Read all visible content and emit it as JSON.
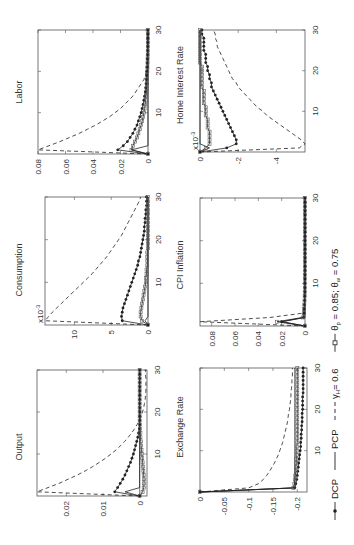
{
  "chart_data": [
    {
      "type": "line",
      "title": "Labor",
      "xlabel": "",
      "ylabel": "",
      "xlim": [
        0,
        30
      ],
      "ylim": [
        0,
        0.08
      ],
      "xticks": [
        "10",
        "20",
        "30"
      ],
      "yticks": [
        "0",
        "0.02",
        "0.04",
        "0.06",
        "0.08"
      ],
      "ytick_values": [
        0,
        0.02,
        0.04,
        0.06,
        0.08
      ],
      "scale_label": "",
      "series": [
        {
          "name": "DCP",
          "values": [
            0,
            0.022,
            0.018,
            0.015,
            0.013,
            0.011,
            0.0095,
            0.008,
            0.007,
            0.006,
            0.005,
            0.0043,
            0.0036,
            0.003,
            0.0025,
            0.002,
            0.0017,
            0.0014,
            0.0012,
            0.001,
            0.0008,
            0.0007,
            0.0006,
            0.0005,
            0.0004,
            0.0003,
            0.0003,
            0.0002,
            0.0002,
            0.0001,
            0.0001
          ]
        },
        {
          "name": "PCP",
          "values": [
            0,
            0.012,
            0,
            0,
            0,
            0,
            0,
            0,
            0,
            0,
            0,
            0,
            0,
            0,
            0,
            0,
            0,
            0,
            0,
            0,
            0,
            0,
            0,
            0,
            0,
            0,
            0,
            0,
            0,
            0,
            0
          ]
        },
        {
          "name": "gamma_H = 0.6",
          "values": [
            0,
            0.08,
            0.072,
            0.064,
            0.057,
            0.05,
            0.044,
            0.038,
            0.033,
            0.028,
            0.024,
            0.02,
            0.017,
            0.014,
            0.011,
            0.009,
            0.007,
            0.005,
            0.003,
            0.002,
            0.001,
            0,
            0,
            0,
            0,
            0,
            0,
            0,
            0,
            0,
            0
          ]
        },
        {
          "name": "theta_p = 0.85; theta_w = 0.75",
          "values": [
            0,
            0.012,
            0.011,
            0.0095,
            0.008,
            0.007,
            0.006,
            0.005,
            0.0042,
            0.0035,
            0.003,
            0.0025,
            0.002,
            0.0017,
            0.0014,
            0.0012,
            0.001,
            0.0008,
            0.0007,
            0.0006,
            0.0005,
            0.0004,
            0.0003,
            0.0003,
            0.0002,
            0.0002,
            0.0001,
            0.0001,
            0.0001,
            0.0001,
            0
          ]
        }
      ]
    },
    {
      "type": "line",
      "title": "Consumption",
      "xlim": [
        0,
        30
      ],
      "ylim": [
        0,
        0.014
      ],
      "xticks": [
        "10",
        "20",
        "30"
      ],
      "yticks": [
        "0",
        "5",
        "10"
      ],
      "ytick_values": [
        0,
        0.005,
        0.01
      ],
      "scale_label": "x10^-3",
      "series": [
        {
          "name": "DCP",
          "values": [
            0,
            0.0035,
            0.0036,
            0.0035,
            0.0034,
            0.0032,
            0.003,
            0.0028,
            0.0026,
            0.0024,
            0.0022,
            0.002,
            0.0018,
            0.0016,
            0.0014,
            0.0013,
            0.0011,
            0.001,
            0.0009,
            0.0008,
            0.0007,
            0.0006,
            0.0005,
            0.0005,
            0.0004,
            0.0004,
            0.0003,
            0.0003,
            0.0002,
            0.0002,
            0.0002
          ]
        },
        {
          "name": "PCP",
          "values": [
            0,
            0.0004,
            0,
            0,
            0,
            0,
            0,
            0,
            0,
            0,
            0,
            0,
            0,
            0,
            0,
            0,
            0,
            0,
            0,
            0,
            0,
            0,
            0,
            0,
            0,
            0,
            0,
            0,
            0,
            0,
            0
          ]
        },
        {
          "name": "gamma_H = 0.6",
          "values": [
            0,
            0.014,
            0.0135,
            0.013,
            0.0124,
            0.0118,
            0.0112,
            0.0106,
            0.01,
            0.0094,
            0.0088,
            0.0082,
            0.0076,
            0.0071,
            0.0066,
            0.0061,
            0.0056,
            0.0052,
            0.0048,
            0.0044,
            0.004,
            0.0036,
            0.0033,
            0.003,
            0.0027,
            0.0024,
            0.0021,
            0.0018,
            0.0015,
            0.0012,
            0.001
          ]
        },
        {
          "name": "theta_p = 0.85; theta_w = 0.75",
          "values": [
            0,
            0.0008,
            0.001,
            0.001,
            0.0009,
            0.0008,
            0.0007,
            0.0006,
            0.0005,
            0.0004,
            0.0003,
            0.0003,
            0.0002,
            0.0002,
            0.0001,
            0.0001,
            0.0001,
            0.0001,
            0,
            0,
            0,
            0,
            0,
            0,
            0,
            0,
            0,
            0,
            0,
            0,
            0
          ]
        }
      ]
    },
    {
      "type": "line",
      "title": "Output",
      "xlim": [
        0,
        30
      ],
      "ylim": [
        -0.002,
        0.028
      ],
      "xticks": [
        "10",
        "20",
        "30"
      ],
      "yticks": [
        "0",
        "0.01",
        "0.02"
      ],
      "ytick_values": [
        0,
        0.01,
        0.02
      ],
      "scale_label": "",
      "series": [
        {
          "name": "DCP",
          "values": [
            0,
            0.0068,
            0.006,
            0.0053,
            0.0046,
            0.004,
            0.0035,
            0.003,
            0.0025,
            0.0021,
            0.0017,
            0.0014,
            0.0011,
            0.0008,
            0.0005,
            0.0003,
            0.0001,
            0,
            0,
            0,
            0,
            0,
            0,
            0,
            0,
            0,
            0,
            0,
            0,
            0,
            0
          ]
        },
        {
          "name": "PCP",
          "values": [
            0,
            0.004,
            0,
            0,
            0,
            0,
            0,
            0,
            0,
            0,
            0,
            0,
            0,
            0,
            0,
            0,
            0,
            0,
            0,
            0,
            0,
            0,
            0,
            0,
            0,
            0,
            0,
            0,
            0,
            0,
            0
          ]
        },
        {
          "name": "gamma_H = 0.6",
          "values": [
            0,
            0.028,
            0.025,
            0.022,
            0.0195,
            0.017,
            0.0148,
            0.0128,
            0.011,
            0.0093,
            0.0078,
            0.0064,
            0.0052,
            0.0041,
            0.0031,
            0.0022,
            0.0014,
            0.0007,
            0.0001,
            -0.0004,
            -0.0008,
            -0.0011,
            -0.0013,
            -0.0015,
            -0.0016,
            -0.0017,
            -0.0017,
            -0.0017,
            -0.0017,
            -0.0016,
            -0.0016
          ]
        },
        {
          "name": "theta_p = 0.85; theta_w = 0.75",
          "values": [
            0,
            -0.0008,
            -0.0011,
            -0.0012,
            -0.0012,
            -0.0011,
            -0.001,
            -0.0009,
            -0.0008,
            -0.0007,
            -0.0006,
            -0.0005,
            -0.0004,
            -0.0003,
            -0.0002,
            -0.0002,
            -0.0001,
            -0.0001,
            0,
            0,
            0,
            0,
            0,
            0,
            0,
            0,
            0,
            0,
            0,
            0,
            0
          ]
        }
      ]
    },
    {
      "type": "line",
      "title": "Home Interest Rate",
      "xlim": [
        0,
        30
      ],
      "ylim": [
        -0.0055,
        0
      ],
      "xticks": [
        "10",
        "20",
        "30"
      ],
      "yticks": [
        "0",
        "-2",
        "-4"
      ],
      "ytick_values": [
        0,
        -0.002,
        -0.004
      ],
      "scale_label": "x10^-3",
      "series": [
        {
          "name": "DCP",
          "values": [
            0,
            -0.0014,
            -0.0019,
            -0.0019,
            -0.0018,
            -0.0017,
            -0.0016,
            -0.0015,
            -0.0014,
            -0.0013,
            -0.0012,
            -0.0011,
            -0.001,
            -0.0009,
            -0.0008,
            -0.0007,
            -0.0006,
            -0.0006,
            -0.0005,
            -0.0005,
            -0.0004,
            -0.0004,
            -0.0003,
            -0.0003,
            -0.0003,
            -0.0002,
            -0.0002,
            -0.0002,
            -0.0002,
            -0.0001,
            -0.0001
          ]
        },
        {
          "name": "PCP",
          "values": [
            0,
            -0.0005,
            0,
            0,
            0,
            0,
            0,
            0,
            0,
            0,
            0,
            0,
            0,
            0,
            0,
            0,
            0,
            0,
            0,
            0,
            0,
            0,
            0,
            0,
            0,
            0,
            0,
            0,
            0,
            0,
            0
          ]
        },
        {
          "name": "gamma_H = 0.6",
          "values": [
            0,
            -0.0052,
            -0.0055,
            -0.0053,
            -0.005,
            -0.0047,
            -0.0044,
            -0.0041,
            -0.0038,
            -0.0035,
            -0.0033,
            -0.003,
            -0.0028,
            -0.0026,
            -0.0024,
            -0.0022,
            -0.002,
            -0.0019,
            -0.0017,
            -0.0016,
            -0.0015,
            -0.0014,
            -0.0013,
            -0.0012,
            -0.0011,
            -0.001,
            -0.0009,
            -0.0009,
            -0.0008,
            -0.0008,
            -0.0007
          ]
        },
        {
          "name": "theta_p = 0.85; theta_w = 0.75",
          "values": [
            0,
            -0.0003,
            -0.0005,
            -0.0005,
            -0.0005,
            -0.0005,
            -0.0004,
            -0.0004,
            -0.0004,
            -0.0003,
            -0.0003,
            -0.0003,
            -0.0002,
            -0.0002,
            -0.0002,
            -0.0002,
            -0.0001,
            -0.0001,
            -0.0001,
            -0.0001,
            -0.0001,
            -0.0001,
            0,
            0,
            0,
            0,
            0,
            0,
            0,
            0,
            0
          ]
        }
      ]
    },
    {
      "type": "line",
      "title": "CPI Inflation",
      "xlim": [
        0,
        30
      ],
      "ylim": [
        0,
        0.09
      ],
      "xticks": [
        "10",
        "20",
        "30"
      ],
      "yticks": [
        "0",
        "0.02",
        "0.04",
        "0.06",
        "0.08"
      ],
      "ytick_values": [
        0,
        0.02,
        0.04,
        0.06,
        0.08
      ],
      "scale_label": "",
      "series": [
        {
          "name": "DCP",
          "values": [
            0,
            0.02,
            0.001,
            0.0008,
            0.0006,
            0.0005,
            0.0004,
            0.0003,
            0.0002,
            0.0002,
            0.0001,
            0.0001,
            0.0001,
            0,
            0,
            0,
            0,
            0,
            0,
            0,
            0,
            0,
            0,
            0,
            0,
            0,
            0,
            0,
            0,
            0,
            0
          ]
        },
        {
          "name": "PCP",
          "values": [
            0,
            0.02,
            0,
            0,
            0,
            0,
            0,
            0,
            0,
            0,
            0,
            0,
            0,
            0,
            0,
            0,
            0,
            0,
            0,
            0,
            0,
            0,
            0,
            0,
            0,
            0,
            0,
            0,
            0,
            0,
            0
          ]
        },
        {
          "name": "gamma_H = 0.6",
          "values": [
            0,
            0.09,
            0.03,
            0.002,
            0.001,
            0.0005,
            0.0003,
            0.0002,
            0.0001,
            0,
            0,
            0,
            0,
            0,
            0,
            0,
            0,
            0,
            0,
            0,
            0,
            0,
            0,
            0,
            0,
            0,
            0,
            0,
            0,
            0,
            0
          ]
        },
        {
          "name": "theta_p = 0.85; theta_w = 0.75",
          "values": [
            0,
            0.024,
            0.002,
            0.001,
            0.0008,
            0.0006,
            0.0004,
            0.0003,
            0.0002,
            0.0001,
            0.0001,
            0,
            0,
            0,
            0,
            0,
            0,
            0,
            0,
            0,
            0,
            0,
            0,
            0,
            0,
            0,
            0,
            0,
            0,
            0,
            0
          ]
        }
      ]
    },
    {
      "type": "line",
      "title": "Exchange Rate",
      "xlim": [
        0,
        30
      ],
      "ylim": [
        -0.22,
        0
      ],
      "xticks": [
        "10",
        "20",
        "30"
      ],
      "yticks": [
        "0",
        "-0.05",
        "-0.1",
        "-0.15",
        "-0.2"
      ],
      "ytick_values": [
        0,
        -0.05,
        -0.1,
        -0.15,
        -0.2
      ],
      "scale_label": "",
      "series": [
        {
          "name": "DCP",
          "values": [
            0,
            -0.195,
            -0.197,
            -0.199,
            -0.2,
            -0.201,
            -0.202,
            -0.203,
            -0.204,
            -0.205,
            -0.206,
            -0.207,
            -0.207,
            -0.208,
            -0.208,
            -0.209,
            -0.209,
            -0.21,
            -0.21,
            -0.21,
            -0.211,
            -0.211,
            -0.211,
            -0.211,
            -0.212,
            -0.212,
            -0.212,
            -0.212,
            -0.212,
            -0.212,
            -0.212
          ]
        },
        {
          "name": "PCP",
          "values": [
            0,
            -0.195,
            -0.195,
            -0.195,
            -0.195,
            -0.195,
            -0.195,
            -0.195,
            -0.195,
            -0.195,
            -0.195,
            -0.195,
            -0.195,
            -0.195,
            -0.195,
            -0.195,
            -0.195,
            -0.195,
            -0.195,
            -0.195,
            -0.195,
            -0.195,
            -0.195,
            -0.195,
            -0.195,
            -0.195,
            -0.195,
            -0.195,
            -0.195,
            -0.195,
            -0.195
          ]
        },
        {
          "name": "gamma_H = 0.6",
          "values": [
            0,
            -0.1,
            -0.12,
            -0.13,
            -0.137,
            -0.143,
            -0.148,
            -0.153,
            -0.157,
            -0.161,
            -0.164,
            -0.167,
            -0.17,
            -0.172,
            -0.174,
            -0.176,
            -0.178,
            -0.18,
            -0.181,
            -0.182,
            -0.184,
            -0.185,
            -0.186,
            -0.187,
            -0.187,
            -0.188,
            -0.189,
            -0.189,
            -0.19,
            -0.19,
            -0.19
          ]
        },
        {
          "name": "theta_p = 0.85; theta_w = 0.75",
          "values": [
            0,
            -0.192,
            -0.194,
            -0.195,
            -0.196,
            -0.197,
            -0.197,
            -0.198,
            -0.198,
            -0.199,
            -0.199,
            -0.199,
            -0.2,
            -0.2,
            -0.2,
            -0.2,
            -0.2,
            -0.2,
            -0.2,
            -0.2,
            -0.2,
            -0.2,
            -0.2,
            -0.2,
            -0.2,
            -0.2,
            -0.2,
            -0.2,
            -0.2,
            -0.2,
            -0.2
          ]
        }
      ]
    }
  ],
  "legend": {
    "placement": "bottom",
    "entries": [
      {
        "key": "DCP",
        "label": "DCP",
        "marker": "asterisk",
        "style": "solid"
      },
      {
        "key": "PCP",
        "label": "PCP",
        "marker": "none",
        "style": "solid"
      },
      {
        "key": "gamma_H",
        "label_prefix": "γ",
        "label_sub": "H",
        "label_suffix": "= 0.6",
        "marker": "none",
        "style": "dashed"
      },
      {
        "key": "theta",
        "label_prefix": "θ",
        "label_sub": "p",
        "label_mid": " = 0.85; θ",
        "label_sub2": "w",
        "label_suffix": " = 0.75",
        "marker": "square",
        "style": "solid"
      }
    ]
  },
  "orientation": "rotated-90-ccw",
  "colors": {
    "line": "#222222",
    "frame": "#555555",
    "text": "#333333"
  }
}
